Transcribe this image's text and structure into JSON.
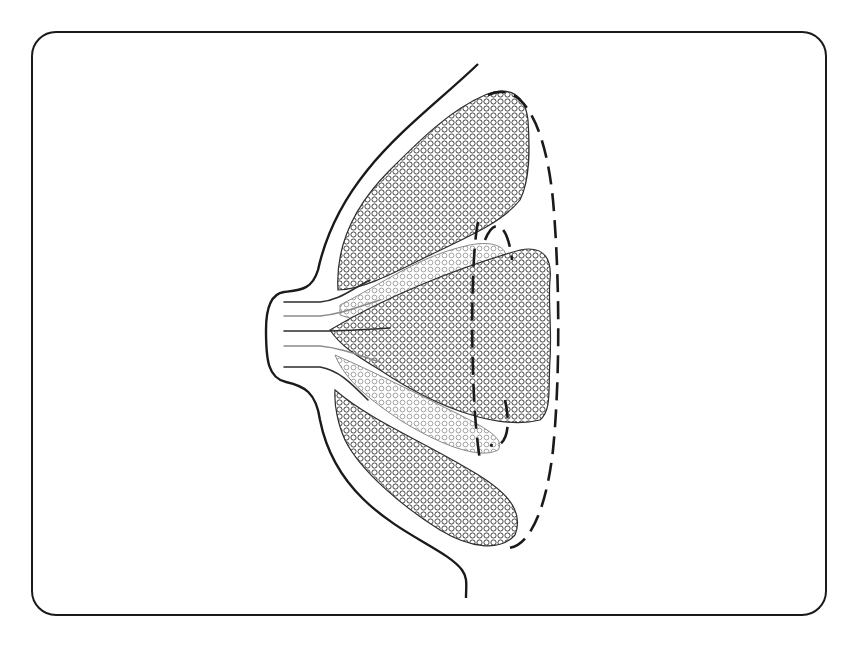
{
  "diagram": {
    "labels": [],
    "colors": {
      "background": "#ffffff",
      "stroke": "#1a1a1a",
      "lobe_dark": "#3a3a3a",
      "lobe_light": "#8a8a8a"
    },
    "frame": {
      "x": 32,
      "y": 32,
      "width": 794,
      "height": 583,
      "radius": 24
    }
  }
}
